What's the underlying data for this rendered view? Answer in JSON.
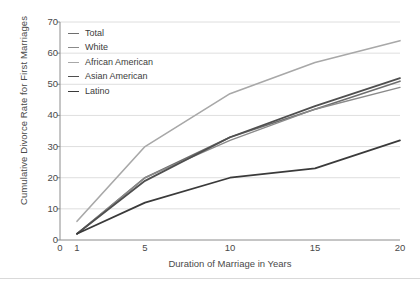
{
  "chart_data": {
    "type": "line",
    "title": "",
    "xlabel": "Duration of Marriage in Years",
    "ylabel": "Cumulative Divorce Rate for First Marriages",
    "xlim": [
      0,
      20
    ],
    "ylim": [
      0,
      70
    ],
    "xticks": [
      "0",
      "1",
      "5",
      "10",
      "15",
      "20"
    ],
    "xtick_values": [
      0,
      1,
      5,
      10,
      15,
      20
    ],
    "yticks": [
      "0",
      "10",
      "20",
      "30",
      "40",
      "50",
      "60",
      "70"
    ],
    "ytick_values": [
      0,
      10,
      20,
      30,
      40,
      50,
      60,
      70
    ],
    "grid": "horizontal",
    "legend_position": "top-left",
    "x": [
      1,
      5,
      10,
      15,
      20
    ],
    "series": [
      {
        "name": "Total",
        "color": "#6e6e6e",
        "width": 1.6,
        "values": [
          2,
          20,
          33,
          42,
          51
        ]
      },
      {
        "name": "White",
        "color": "#8a8a8a",
        "width": 1.4,
        "values": [
          2,
          20,
          32,
          42,
          49
        ]
      },
      {
        "name": "African American",
        "color": "#a8a8a8",
        "width": 1.6,
        "values": [
          6,
          30,
          47,
          57,
          64
        ]
      },
      {
        "name": "Asian American",
        "color": "#4f4f4f",
        "width": 1.8,
        "values": [
          2,
          19,
          33,
          43,
          52
        ]
      },
      {
        "name": "Latino",
        "color": "#3a3a3a",
        "width": 1.7,
        "values": [
          2,
          12,
          20,
          23,
          32
        ]
      }
    ]
  },
  "axes": {
    "frame_color": "#8c8c8c",
    "grid_color": "#d6d6d6"
  }
}
